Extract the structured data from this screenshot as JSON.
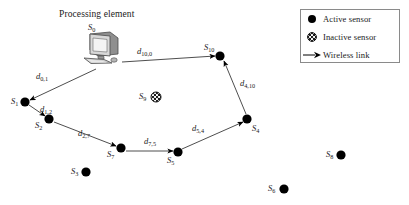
{
  "figure": {
    "title": "Processing element",
    "width": 409,
    "height": 205,
    "background": "#ffffff",
    "stroke_color": "#3a3a3a",
    "node_color": "#000000"
  },
  "legend": {
    "items": [
      {
        "symbol": "active-sensor-dot",
        "label": "Active sensor"
      },
      {
        "symbol": "inactive-sensor-dot",
        "label": "Inactive sensor"
      },
      {
        "symbol": "arrow",
        "label": "Wireless link"
      }
    ]
  },
  "processing_element": {
    "icon": "desktop-computer-icon",
    "node_label": "S",
    "node_index": "0",
    "x": 100,
    "y": 50
  },
  "nodes": [
    {
      "id": "S1",
      "label": "S",
      "index": "1",
      "x": 25,
      "y": 102,
      "state": "active",
      "label_x": 11,
      "label_y": 96
    },
    {
      "id": "S2",
      "label": "S",
      "index": "2",
      "x": 49,
      "y": 119,
      "state": "active",
      "label_x": 35,
      "label_y": 120
    },
    {
      "id": "S3",
      "label": "S",
      "index": "3",
      "x": 86,
      "y": 172,
      "state": "active",
      "label_x": 71,
      "label_y": 166
    },
    {
      "id": "S4",
      "label": "S",
      "index": "4",
      "x": 247,
      "y": 119,
      "state": "active",
      "label_x": 252,
      "label_y": 123
    },
    {
      "id": "S5",
      "label": "S",
      "index": "5",
      "x": 178,
      "y": 152,
      "state": "active",
      "label_x": 167,
      "label_y": 155
    },
    {
      "id": "S6",
      "label": "S",
      "index": "6",
      "x": 284,
      "y": 189,
      "state": "active",
      "label_x": 268,
      "label_y": 183
    },
    {
      "id": "S7",
      "label": "S",
      "index": "7",
      "x": 121,
      "y": 148,
      "state": "active",
      "label_x": 107,
      "label_y": 149
    },
    {
      "id": "S8",
      "label": "S",
      "index": "8",
      "x": 341,
      "y": 155,
      "state": "active",
      "label_x": 326,
      "label_y": 149
    },
    {
      "id": "S9",
      "label": "S",
      "index": "9",
      "x": 156,
      "y": 97,
      "state": "inactive",
      "label_x": 139,
      "label_y": 91
    },
    {
      "id": "S10",
      "label": "S",
      "index": "10",
      "x": 220,
      "y": 56,
      "state": "active",
      "label_x": 204,
      "label_y": 42
    }
  ],
  "links": [
    {
      "id": "d_0_1",
      "from": "S0",
      "to": "S1",
      "label": "d",
      "sub": "0,1",
      "x1": 96,
      "y1": 69,
      "x2": 30,
      "y2": 100,
      "label_x": 36,
      "label_y": 71
    },
    {
      "id": "d_1_2",
      "from": "S1",
      "to": "S2",
      "label": "d",
      "sub": "1,2",
      "x1": 29,
      "y1": 105,
      "x2": 45,
      "y2": 116,
      "label_x": 40,
      "label_y": 104
    },
    {
      "id": "d_2_7",
      "from": "S2",
      "to": "S7",
      "label": "d",
      "sub": "2,7",
      "x1": 54,
      "y1": 122,
      "x2": 116,
      "y2": 146,
      "label_x": 78,
      "label_y": 128
    },
    {
      "id": "d_7_5",
      "from": "S7",
      "to": "S5",
      "label": "d",
      "sub": "7,5",
      "x1": 126,
      "y1": 151,
      "x2": 173,
      "y2": 151,
      "label_x": 144,
      "label_y": 136
    },
    {
      "id": "d_5_4",
      "from": "S5",
      "to": "S4",
      "label": "d",
      "sub": "5,4",
      "x1": 182,
      "y1": 149,
      "x2": 243,
      "y2": 122,
      "label_x": 192,
      "label_y": 123
    },
    {
      "id": "d_4_10",
      "from": "S4",
      "to": "S10",
      "label": "d",
      "sub": "4,10",
      "x1": 246,
      "y1": 114,
      "x2": 224,
      "y2": 61,
      "label_x": 240,
      "label_y": 78
    },
    {
      "id": "d_10_0",
      "from": "S10",
      "to": "S0",
      "label": "d",
      "sub": "10,0",
      "x1": 122,
      "y1": 62,
      "x2": 215,
      "y2": 56,
      "label_x": 137,
      "label_y": 46
    }
  ]
}
